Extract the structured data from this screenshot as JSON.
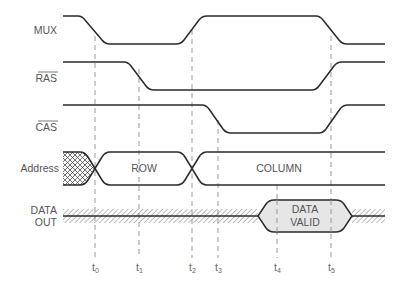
{
  "diagram": {
    "type": "timing-diagram",
    "signals": [
      {
        "id": "mux",
        "label": "MUX",
        "overbar": false
      },
      {
        "id": "ras",
        "label": "RAS",
        "overbar": true
      },
      {
        "id": "cas",
        "label": "CAS",
        "overbar": true
      },
      {
        "id": "address",
        "label": "Address",
        "overbar": false
      },
      {
        "id": "data_out",
        "label_line1": "DATA",
        "label_line2": "OUT",
        "overbar": false
      }
    ],
    "address_phases": {
      "row": "ROW",
      "column": "COLUMN"
    },
    "data_valid": {
      "line1": "DATA",
      "line2": "VALID"
    },
    "time_markers": [
      {
        "base": "t",
        "sub": "0"
      },
      {
        "base": "t",
        "sub": "1"
      },
      {
        "base": "t",
        "sub": "2"
      },
      {
        "base": "t",
        "sub": "3"
      },
      {
        "base": "t",
        "sub": "4"
      },
      {
        "base": "t",
        "sub": "5"
      }
    ],
    "colors": {
      "line": "#2a2a2a",
      "dash": "#9a9a9a",
      "text": "#555555",
      "valid_fill": "#e6e6e6",
      "hatch": "#666666"
    }
  }
}
